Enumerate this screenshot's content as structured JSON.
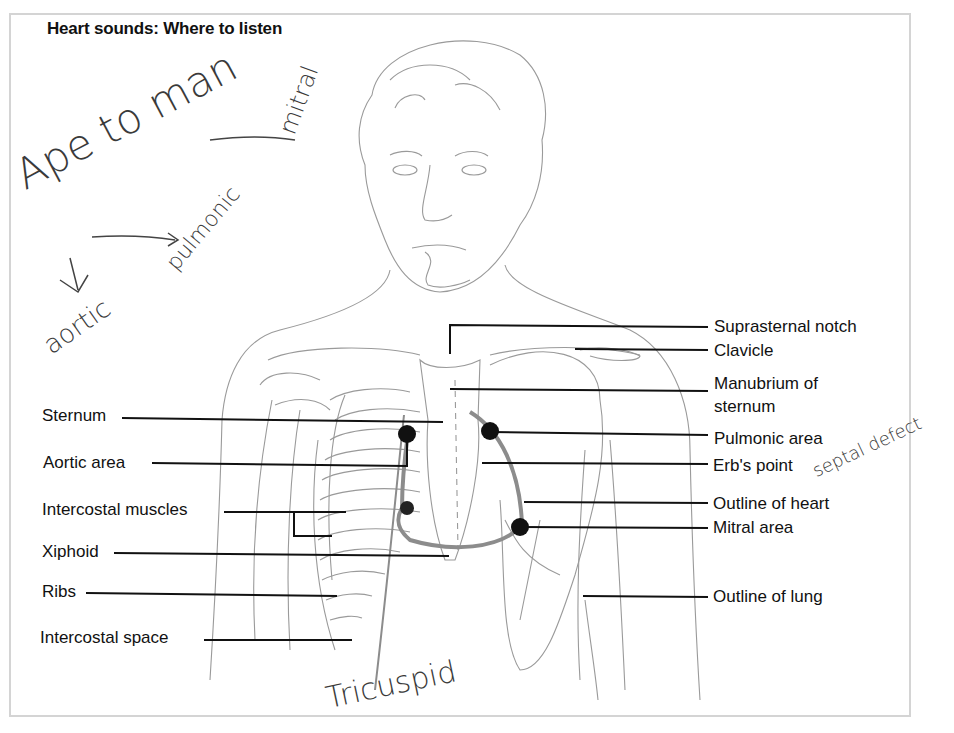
{
  "title": "Heart sounds: Where to listen",
  "left_labels": [
    {
      "text": "Sternum"
    },
    {
      "text": "Aortic area"
    },
    {
      "text": "Intercostal muscles"
    },
    {
      "text": "Xiphoid"
    },
    {
      "text": "Ribs"
    },
    {
      "text": "Intercostal space"
    }
  ],
  "right_labels": [
    {
      "text": "Suprasternal notch"
    },
    {
      "text": "Clavicle"
    },
    {
      "text": "Manubrium of"
    },
    {
      "text": "sternum"
    },
    {
      "text": "Pulmonic area"
    },
    {
      "text": "Erb's point"
    },
    {
      "text": "Outline of heart"
    },
    {
      "text": "Mitral area"
    },
    {
      "text": "Outline of lung"
    }
  ],
  "handwriting": {
    "mnemonic": "Ape to man",
    "mitral": "mitral",
    "pulmonic": "pulmonic",
    "aortic": "aortic",
    "septal_defect": "septal defect",
    "tricuspid": "Tricuspid"
  },
  "auscultation_points": [
    "Aortic area",
    "Pulmonic area",
    "Erb's point / Tricuspid",
    "Mitral area"
  ],
  "colors": {
    "line": "#111111",
    "sketch": "#8a8a8a",
    "heart_outline": "#8c8c8c",
    "frame": "#d4d4d4",
    "dot": "#111111"
  }
}
